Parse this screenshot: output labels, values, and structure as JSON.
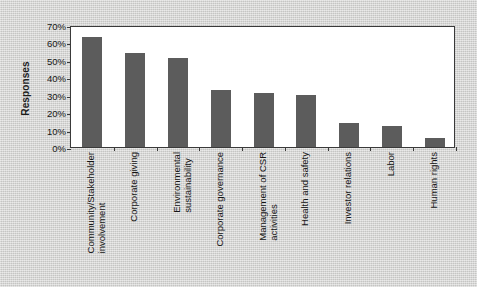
{
  "chart_data": {
    "type": "bar",
    "title": "",
    "xlabel": "",
    "ylabel": "Responses",
    "ylim": [
      0,
      70
    ],
    "ytick_values": [
      70,
      60,
      50,
      40,
      30,
      20,
      10,
      0
    ],
    "ytick_labels": [
      "70%",
      "60%",
      "50%",
      "40%",
      "30%",
      "20%",
      "10%",
      "0%"
    ],
    "grid": false,
    "legend": "none",
    "bar_color": "#5c5c5c",
    "plot_background": "#ffffff",
    "page_background": "#d3d3d1",
    "categories": [
      "Community/Stakeholder involvement",
      "Corporate giving",
      "Environmental sustainability",
      "Corporate governance",
      "Management of CSR activities",
      "Health and safety",
      "Investor relations",
      "Labor",
      "Human rights"
    ],
    "category_lines": [
      [
        "Community/Stakeholder",
        "involvement"
      ],
      [
        "Corporate giving",
        ""
      ],
      [
        "Environmental",
        "sustainability"
      ],
      [
        "Corporate governance",
        ""
      ],
      [
        "Management of CSR",
        "activities"
      ],
      [
        "Health and safety",
        ""
      ],
      [
        "Investor relations",
        ""
      ],
      [
        "Labor",
        ""
      ],
      [
        "Human rights",
        ""
      ]
    ],
    "values": [
      63,
      54,
      51,
      33,
      31,
      30,
      14,
      12,
      5
    ]
  }
}
